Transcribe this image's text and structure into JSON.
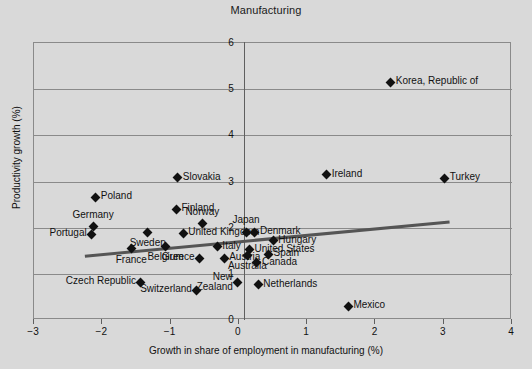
{
  "chart_data": {
    "type": "scatter",
    "title": "Manufacturing",
    "xlabel": "Growth in share of employment in manufacturing (%)",
    "ylabel": "Productivity growth (%)",
    "xlim": [
      -3,
      4
    ],
    "ylim": [
      0,
      6
    ],
    "xticks": [
      "−3",
      "−2",
      "−1",
      "0",
      "1",
      "2",
      "3",
      "4"
    ],
    "xtick_values": [
      -3,
      -2,
      -1,
      0,
      1,
      2,
      3,
      4
    ],
    "yticks": [
      "0",
      "1",
      "2",
      "3",
      "4",
      "5",
      "6"
    ],
    "ytick_values": [
      0,
      1,
      2,
      3,
      4,
      5,
      6
    ],
    "grid": "horizontal-and-vertical-at-zero",
    "legend": "none",
    "marker": "diamond",
    "marker_color": "#111111",
    "trendline": {
      "label": "linear fit",
      "color": "#555555",
      "x_start": -2.24,
      "y_start": 1.36,
      "x_end": 3.1,
      "y_end": 2.1
    },
    "points": [
      {
        "name": "Korea, Republic of",
        "x": 2.24,
        "y": 5.13,
        "label_pos": "right"
      },
      {
        "name": "Turkey",
        "x": 3.03,
        "y": 3.05,
        "label_pos": "right"
      },
      {
        "name": "Ireland",
        "x": 1.3,
        "y": 3.12,
        "label_pos": "right"
      },
      {
        "name": "Slovakia",
        "x": -0.88,
        "y": 3.06,
        "label_pos": "right"
      },
      {
        "name": "Poland",
        "x": -2.08,
        "y": 2.64,
        "label_pos": "right"
      },
      {
        "name": "Finland",
        "x": -0.9,
        "y": 2.38,
        "label_pos": "right"
      },
      {
        "name": "Norway",
        "x": -0.52,
        "y": 2.06,
        "label_pos": "above"
      },
      {
        "name": "Germany",
        "x": -2.12,
        "y": 2.0,
        "label_pos": "above"
      },
      {
        "name": "Portugal",
        "x": -2.14,
        "y": 1.84,
        "label_pos": "left"
      },
      {
        "name": "Sweden",
        "x": -1.32,
        "y": 1.88,
        "label_pos": "below"
      },
      {
        "name": "United Kingdom",
        "x": -0.8,
        "y": 1.86,
        "label_pos": "right"
      },
      {
        "name": "Japan",
        "x": 0.12,
        "y": 1.88,
        "label_pos": "above"
      },
      {
        "name": "Denmark",
        "x": 0.25,
        "y": 1.88,
        "label_pos": "right"
      },
      {
        "name": "Hungary",
        "x": 0.52,
        "y": 1.7,
        "label_pos": "right"
      },
      {
        "name": "Belgium",
        "x": -1.06,
        "y": 1.58,
        "label_pos": "below"
      },
      {
        "name": "France",
        "x": -1.56,
        "y": 1.52,
        "label_pos": "below"
      },
      {
        "name": "Italy",
        "x": -0.3,
        "y": 1.56,
        "label_pos": "right"
      },
      {
        "name": "United States",
        "x": 0.17,
        "y": 1.5,
        "label_pos": "right"
      },
      {
        "name": "Australia",
        "x": 0.14,
        "y": 1.38,
        "label_pos": "below"
      },
      {
        "name": "Spain",
        "x": 0.45,
        "y": 1.4,
        "label_pos": "right"
      },
      {
        "name": "Greece",
        "x": -0.56,
        "y": 1.32,
        "label_pos": "left"
      },
      {
        "name": "Austria",
        "x": -0.2,
        "y": 1.32,
        "label_pos": "right"
      },
      {
        "name": "Canada",
        "x": 0.28,
        "y": 1.22,
        "label_pos": "right"
      },
      {
        "name": "Czech Republic",
        "x": -1.42,
        "y": 0.8,
        "label_pos": "left"
      },
      {
        "name": "New\nZealand",
        "x": 0.0,
        "y": 0.78,
        "label_pos": "below-left"
      },
      {
        "name": "Netherlands",
        "x": 0.3,
        "y": 0.74,
        "label_pos": "right"
      },
      {
        "name": "Switzerland",
        "x": -0.6,
        "y": 0.62,
        "label_pos": "left"
      },
      {
        "name": "Mexico",
        "x": 1.62,
        "y": 0.28,
        "label_pos": "right"
      }
    ]
  }
}
